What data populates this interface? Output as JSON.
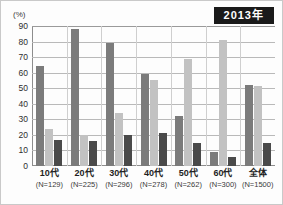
{
  "header": {
    "year_badge": "2013年"
  },
  "axis": {
    "unit_label": "(%)",
    "y_ticks": [
      "90",
      "80",
      "70",
      "60",
      "50",
      "40",
      "30",
      "20",
      "10",
      "0"
    ]
  },
  "colors": {
    "series1": "#7b7b7b",
    "series2": "#c2c2c2",
    "series3": "#4a4a4a",
    "badge_bg": "#1a1a1a",
    "badge_text": "#ffffff",
    "grid": "#b9b9b9",
    "axis": "#8d8d8d"
  },
  "x_labels": [
    {
      "cat": "10代",
      "n": "(N=129)"
    },
    {
      "cat": "20代",
      "n": "(N=225)"
    },
    {
      "cat": "30代",
      "n": "(N=296)"
    },
    {
      "cat": "40代",
      "n": "(N=278)"
    },
    {
      "cat": "50代",
      "n": "(N=262)"
    },
    {
      "cat": "60代",
      "n": "(N=300)"
    },
    {
      "cat": "全体",
      "n": "(N=1500)"
    }
  ],
  "chart_data": {
    "type": "bar",
    "title": "2013年",
    "xlabel": "",
    "ylabel": "(%)",
    "ylim": [
      0,
      90
    ],
    "ytick_step": 10,
    "grid": true,
    "legend_position": "none",
    "categories": [
      "10代",
      "20代",
      "30代",
      "40代",
      "50代",
      "60代",
      "全体"
    ],
    "sample_sizes": [
      "(N=129)",
      "(N=225)",
      "(N=296)",
      "(N=278)",
      "(N=262)",
      "(N=300)",
      "(N=1500)"
    ],
    "series": [
      {
        "name": "series-1",
        "color": "#7b7b7b",
        "values": [
          64,
          88,
          79,
          59,
          32,
          9,
          52
        ]
      },
      {
        "name": "series-2",
        "color": "#c2c2c2",
        "values": [
          24,
          20,
          34,
          55,
          69,
          81,
          51.5
        ]
      },
      {
        "name": "series-3",
        "color": "#4a4a4a",
        "values": [
          17,
          16,
          20,
          21,
          15,
          6,
          15
        ]
      }
    ]
  }
}
